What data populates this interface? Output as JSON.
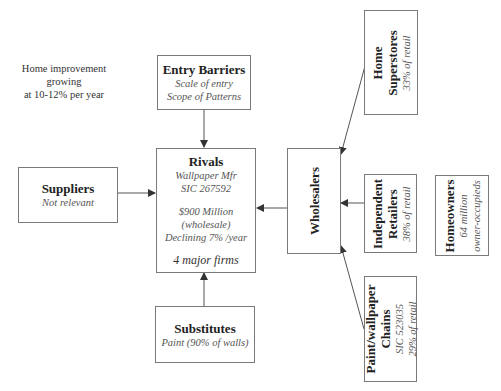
{
  "note": {
    "line1": "Home improvement growing",
    "line2": "at 10-12% per year"
  },
  "entry_barriers": {
    "title": "Entry Barriers",
    "lines": [
      "Scale of entry",
      "Scope of Patterns"
    ]
  },
  "rivals": {
    "title": "Rivals",
    "lines": [
      "Wallpaper Mfr",
      "SIC 267592",
      "$900 Million",
      "(wholesale)",
      "Declining 7% /year"
    ],
    "emphasis": "4 major firms"
  },
  "suppliers": {
    "title": "Suppliers",
    "lines": [
      "Not relevant"
    ]
  },
  "substitutes": {
    "title": "Substitutes",
    "lines": [
      "Paint (90% of walls)"
    ]
  },
  "wholesalers": {
    "title": "Wholesalers"
  },
  "home_superstores": {
    "title_lines": [
      "Home",
      "Superstores"
    ],
    "lines": [
      "33% of retail"
    ]
  },
  "independent_retailers": {
    "title_lines": [
      "Independent",
      "Retailers"
    ],
    "lines": [
      "38% of retail"
    ]
  },
  "paint_chains": {
    "title_lines": [
      "Paint/wallpaper",
      "Chains"
    ],
    "lines": [
      "SIC 523035",
      "29% of retail"
    ]
  },
  "homeowners": {
    "title": "Homeowners",
    "lines": [
      "64 million",
      "owner-occupieds"
    ]
  },
  "colors": {
    "border": "#7a7a7a",
    "line": "#555555",
    "text": "#222222",
    "subtext": "#555555"
  }
}
